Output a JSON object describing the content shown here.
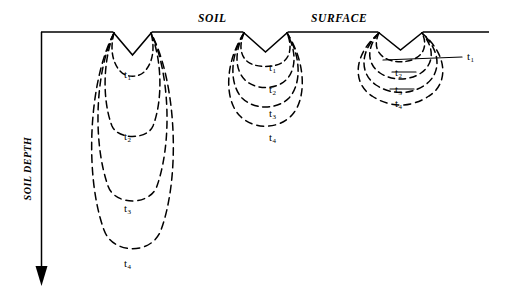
{
  "figure": {
    "kind": "soil-wetting-front-diagram",
    "headers": {
      "soil": "SOIL",
      "surface": "SURFACE"
    },
    "axis": {
      "depth_label": "SOIL DEPTH",
      "direction": "downward",
      "arrow_icon": "down-arrow-icon"
    },
    "colors": {
      "ink": "#000000",
      "background": "#ffffff"
    },
    "time_steps": [
      "t1",
      "t2",
      "t3",
      "t4"
    ]
  },
  "labels": {
    "t1": "t",
    "t2": "t",
    "t3": "t",
    "t4": "t",
    "sub1": "1",
    "sub2": "2",
    "sub3": "3",
    "sub4": "4"
  },
  "groups": [
    {
      "name": "narrow-deep-furrow",
      "position": "left",
      "notch_left_x": 113,
      "notch_right_x": 152,
      "notch_apex_y": 55,
      "surface_y": 32,
      "fronts": [
        {
          "step": "t1",
          "label_x": 128,
          "label_y": 74,
          "depth": 75
        },
        {
          "step": "t2",
          "label_x": 128,
          "label_y": 136,
          "depth": 140
        },
        {
          "step": "t3",
          "label_x": 128,
          "label_y": 208,
          "depth": 212
        },
        {
          "step": "t4",
          "label_x": 128,
          "label_y": 262,
          "depth": 262
        }
      ]
    },
    {
      "name": "intermediate-furrow",
      "position": "middle",
      "notch_left_x": 243,
      "notch_right_x": 288,
      "notch_apex_y": 52,
      "surface_y": 32,
      "fronts": [
        {
          "step": "t1",
          "label_x": 272,
          "label_y": 67,
          "depth": 62
        },
        {
          "step": "t2",
          "label_x": 272,
          "label_y": 89,
          "depth": 87
        },
        {
          "step": "t3",
          "label_x": 272,
          "label_y": 113,
          "depth": 113
        },
        {
          "step": "t4",
          "label_x": 272,
          "label_y": 137,
          "depth": 139
        }
      ]
    },
    {
      "name": "wide-shallow-furrow",
      "position": "right",
      "notch_left_x": 378,
      "notch_right_x": 423,
      "notch_apex_y": 50,
      "surface_y": 32,
      "fronts": [
        {
          "step": "t1",
          "label_x": 466,
          "label_y": 57,
          "depth": 52
        },
        {
          "step": "t2",
          "label_x": 398,
          "label_y": 73,
          "depth": 70
        },
        {
          "step": "t3",
          "label_x": 398,
          "label_y": 90,
          "depth": 87
        },
        {
          "step": "t4",
          "label_x": 398,
          "label_y": 103,
          "depth": 101
        }
      ]
    }
  ]
}
